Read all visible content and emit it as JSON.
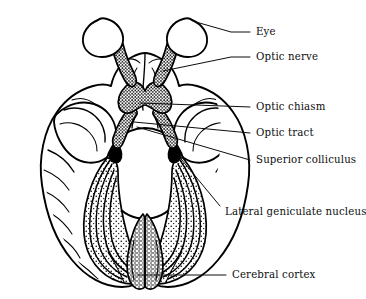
{
  "figure": {
    "background_color": "#ffffff",
    "ink_color": "#000000",
    "width": 366,
    "height": 299
  },
  "labels": [
    {
      "id": "eye",
      "text": "Eye",
      "text_x": 256,
      "text_y": 32,
      "leader": "M 199 32 L 232 32 M 232 32 L 199 32",
      "leader_path": "M 250 32 L 232 32 L 172 19"
    },
    {
      "id": "optic-nerve",
      "text": "Optic nerve",
      "text_x": 256,
      "text_y": 57,
      "leader_path": "M 250 57 L 232 57 L 161 72"
    },
    {
      "id": "optic-chiasm",
      "text": "Optic chiasm",
      "text_x": 256,
      "text_y": 107,
      "leader_path": "M 250 107 L 232 107 L 139 104"
    },
    {
      "id": "optic-tract",
      "text": "Optic tract",
      "text_x": 256,
      "text_y": 133,
      "leader_path": "M 250 133 L 232 133 L 133 123"
    },
    {
      "id": "superior-colliculus",
      "text": "Superior colliculus",
      "text_x": 256,
      "text_y": 160,
      "leader_path": "M 250 160 L 232 160 L 136 128"
    },
    {
      "id": "lateral-geniculate-nucleus",
      "text": "Lateral geniculate nucleus",
      "text_x": 225,
      "text_y": 212,
      "leader_path": "M 219 207 L 176 155"
    },
    {
      "id": "cerebral-cortex",
      "text": "Cerebral cortex",
      "text_x": 232,
      "text_y": 275,
      "leader_path": "M 226 275 L 137 275"
    }
  ],
  "anatomy": {
    "structures": [
      "eye-left",
      "eye-right",
      "optic-nerve-left",
      "optic-nerve-right",
      "optic-chiasm",
      "optic-tract-left",
      "optic-tract-right",
      "lateral-geniculate-nucleus-left",
      "lateral-geniculate-nucleus-right",
      "optic-radiation-left",
      "optic-radiation-right",
      "frontal-lobe",
      "temporal-lobe-left",
      "temporal-lobe-right",
      "occipital-lobe",
      "brainstem"
    ],
    "view": "inferior (ventral) view",
    "texture": "stippled shading on visual pathway structures"
  }
}
